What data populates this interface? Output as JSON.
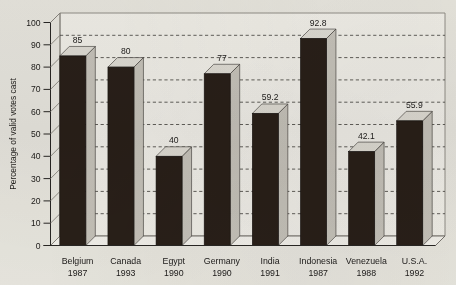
{
  "chart_data": {
    "type": "bar",
    "title": "",
    "xlabel": "",
    "ylabel": "Percentage of valid votes cast",
    "ylim": [
      0,
      100
    ],
    "ytick_step": 10,
    "yticks": [
      "0",
      "10",
      "20",
      "30",
      "40",
      "50",
      "60",
      "70",
      "80",
      "90",
      "100"
    ],
    "grid": true,
    "legend": "none",
    "style": "3d-bars",
    "categories": [
      "Belgium",
      "Canada",
      "Egypt",
      "Germany",
      "India",
      "Indonesia",
      "Venezuela",
      "U.S.A."
    ],
    "category_years": [
      "1987",
      "1993",
      "1990",
      "1990",
      "1991",
      "1987",
      "1988",
      "1992"
    ],
    "values": [
      85,
      80,
      40,
      77,
      59.2,
      92.8,
      42.1,
      55.9
    ],
    "value_labels": [
      "85",
      "80",
      "40",
      "77",
      "59.2",
      "92.8",
      "42.1",
      "55.9"
    ],
    "points": [
      {
        "category": "Belgium",
        "year": "1987",
        "value": 85,
        "label": "85"
      },
      {
        "category": "Canada",
        "year": "1993",
        "value": 80,
        "label": "80"
      },
      {
        "category": "Egypt",
        "year": "1990",
        "value": 40,
        "label": "40"
      },
      {
        "category": "Germany",
        "year": "1990",
        "value": 77,
        "label": "77"
      },
      {
        "category": "India",
        "year": "1991",
        "value": 59.2,
        "label": "59.2"
      },
      {
        "category": "Indonesia",
        "year": "1987",
        "value": 92.8,
        "label": "92.8"
      },
      {
        "category": "Venezuela",
        "year": "1988",
        "value": 42.1,
        "label": "42.1"
      },
      {
        "category": "U.S.A.",
        "year": "1992",
        "value": 55.9,
        "label": "55.9"
      }
    ]
  },
  "colors": {
    "bar_front": "#2b211a",
    "bar_side": "#cfccc6",
    "bar_top": "#e8e6e1",
    "axis": "#2a2826",
    "gridline": "#4a4845",
    "background": "#f2f1ed"
  }
}
